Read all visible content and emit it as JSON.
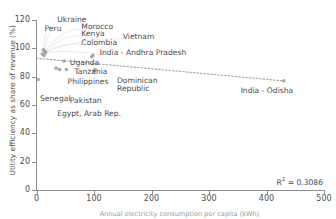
{
  "axes": {
    "ylabel": "Utility efficiency as share of revenue (%)",
    "xlabel": "Annual electricity consumption per capita (kWh)",
    "yticks": [
      "0",
      "20",
      "40",
      "60",
      "80",
      "100",
      "120"
    ],
    "xticks": [
      "0",
      "100",
      "200",
      "300",
      "400",
      "500"
    ]
  },
  "annotation": {
    "r2_prefix": "R",
    "r2_sup": "2",
    "r2_value": " = 0.3086"
  },
  "chart_data": {
    "type": "scatter",
    "title": "",
    "xlabel": "Annual electricity consumption per capita (kWh)",
    "ylabel": "Utility efficiency as share of revenue (%)",
    "xlim": [
      0,
      500
    ],
    "ylim": [
      0,
      120
    ],
    "xticks": [
      0,
      100,
      200,
      300,
      400,
      500
    ],
    "yticks": [
      0,
      20,
      40,
      60,
      80,
      100,
      120
    ],
    "grid": false,
    "legend": null,
    "marker_color": "#9b9b9b",
    "trendline": {
      "style": "dotted",
      "color": "#9b9b9b",
      "x": [
        0,
        430
      ],
      "y": [
        93,
        77
      ],
      "r_squared": 0.3086,
      "r_squared_label": "R² = 0.3086"
    },
    "points": [
      {
        "label": "Ukraine",
        "x": 12,
        "y": 99
      },
      {
        "label": "Peru",
        "x": 14,
        "y": 98
      },
      {
        "label": "Morocco",
        "x": 16,
        "y": 97
      },
      {
        "label": "Kenya",
        "x": 10,
        "y": 96
      },
      {
        "label": "Colombia",
        "x": 13,
        "y": 95
      },
      {
        "label": "Senegal",
        "x": 3,
        "y": 78
      },
      {
        "label": "Uganda",
        "x": 48,
        "y": 91
      },
      {
        "label": "Tanzania",
        "x": 40,
        "y": 85
      },
      {
        "label": "Pakistan",
        "x": 34,
        "y": 86
      },
      {
        "label": "Egypt, Arab Rep.",
        "x": 52,
        "y": 85
      },
      {
        "label": "Philippines",
        "x": 102,
        "y": 85
      },
      {
        "label": "Vietnam",
        "x": 98,
        "y": 95
      },
      {
        "label": "Dominican Republic",
        "x": 100,
        "y": 84
      },
      {
        "label": "India - Andhra Pradesh",
        "x": 96,
        "y": 94
      },
      {
        "label": "India - Odisha",
        "x": 430,
        "y": 77
      }
    ],
    "annotations": [
      {
        "text": "Ukraine",
        "x": 36,
        "y": 120
      },
      {
        "text": "Peru",
        "x": 14,
        "y": 114
      },
      {
        "text": "Morocco",
        "x": 78,
        "y": 115
      },
      {
        "text": "Kenya",
        "x": 78,
        "y": 110
      },
      {
        "text": "Colombia",
        "x": 78,
        "y": 104
      },
      {
        "text": "Vietnam",
        "x": 150,
        "y": 108
      },
      {
        "text": "India - Andhra Pradesh",
        "x": 110,
        "y": 97
      },
      {
        "text": "Uganda",
        "x": 58,
        "y": 90
      },
      {
        "text": "Tanzania",
        "x": 66,
        "y": 83
      },
      {
        "text": "Philippines",
        "x": 54,
        "y": 76
      },
      {
        "text": "Dominican",
        "x": 140,
        "y": 77
      },
      {
        "text": "Republic",
        "x": 140,
        "y": 71
      },
      {
        "text": "Senegal",
        "x": 6,
        "y": 64
      },
      {
        "text": "Pakistan",
        "x": 58,
        "y": 63
      },
      {
        "text": "Egypt, Arab Rep.",
        "x": 36,
        "y": 54
      },
      {
        "text": "India - Odisha",
        "x": 355,
        "y": 70
      }
    ]
  }
}
